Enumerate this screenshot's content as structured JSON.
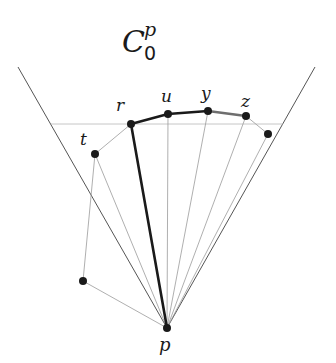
{
  "title": {
    "main": "C",
    "superscript": "p",
    "subscript": "0"
  },
  "colors": {
    "background": "#ffffff",
    "cone": "#555555",
    "ray": "#9a9a9a",
    "dashed": "#b0b0b0",
    "chain_bold": "#1a1a1a",
    "chain_gray": "#6e6e6e",
    "point": "#1a1a1a"
  },
  "points": {
    "p": {
      "label": "p",
      "x": 167,
      "y": 328
    },
    "r": {
      "label": "r",
      "x": 131,
      "y": 124
    },
    "u": {
      "label": "u",
      "x": 168,
      "y": 114
    },
    "y": {
      "label": "y",
      "x": 208,
      "y": 111
    },
    "z": {
      "label": "z",
      "x": 246,
      "y": 116
    },
    "w": {
      "label": "",
      "x": 268,
      "y": 134
    },
    "t": {
      "label": "t",
      "x": 95,
      "y": 154
    },
    "v": {
      "label": "",
      "x": 83,
      "y": 281
    }
  },
  "labels": {
    "p": "p",
    "r": "r",
    "u": "u",
    "y": "y",
    "z": "z",
    "t": "t"
  },
  "cone": {
    "left_end": {
      "x": 18,
      "y": 67
    },
    "right_end": {
      "x": 315,
      "y": 67
    }
  },
  "horizontal_line": {
    "x1": 51,
    "x2": 283,
    "y": 124
  }
}
